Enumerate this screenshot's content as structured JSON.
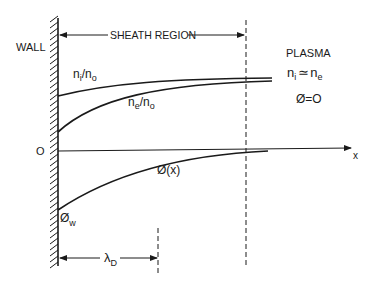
{
  "diagram": {
    "wall_label": "WALL",
    "sheath_label": "SHEATH REGION",
    "plasma": {
      "title": "PLASMA",
      "relation_lhs": "n",
      "relation_lhs_sub": "i",
      "relation_op": "≃",
      "relation_rhs": "n",
      "relation_rhs_sub": "e",
      "potential": "Ø=O"
    },
    "curves": {
      "ion_density": {
        "num": "n",
        "num_sub": "i",
        "slash": "/",
        "den": "n",
        "den_sub": "o"
      },
      "electron_density": {
        "num": "n",
        "num_sub": "e",
        "slash": "/",
        "den": "n",
        "den_sub": "o"
      },
      "potential": "Ø(x)",
      "wall_potential": "Ø",
      "wall_potential_sub": "w"
    },
    "axis": {
      "origin_label": "O",
      "x_label": "x"
    },
    "debye": {
      "symbol": "λ",
      "sub": "D"
    },
    "colors": {
      "ink": "#1a1a1a",
      "background": "#ffffff"
    }
  }
}
